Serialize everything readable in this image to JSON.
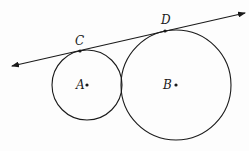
{
  "diagram": {
    "type": "geometry",
    "colors": {
      "stroke": "#1a1a1a",
      "background": "#fdfdfd"
    },
    "circles": [
      {
        "name": "A",
        "label": "A",
        "cx": 87,
        "cy": 85,
        "r": 35
      },
      {
        "name": "B",
        "label": "B",
        "cx": 176,
        "cy": 85,
        "r": 55
      }
    ],
    "tangent_line": {
      "x1": 12,
      "y1": 66,
      "x2": 245,
      "y2": 13,
      "arrows": "both"
    },
    "points": [
      {
        "label": "C",
        "x": 80,
        "y": 51,
        "label_x": 75,
        "label_y": 45
      },
      {
        "label": "D",
        "x": 165,
        "y": 31,
        "label_x": 161,
        "label_y": 24
      }
    ],
    "center_labels": [
      {
        "label": "A",
        "x": 76,
        "y": 89,
        "dot_x": 87,
        "dot_y": 85
      },
      {
        "label": "B",
        "x": 163,
        "y": 89,
        "dot_x": 176,
        "dot_y": 85
      }
    ]
  }
}
